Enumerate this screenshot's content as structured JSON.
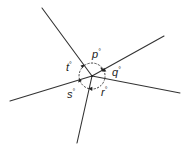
{
  "diagram": {
    "rays": [
      {
        "name": "upper-left"
      },
      {
        "name": "upper-right"
      },
      {
        "name": "right"
      },
      {
        "name": "lower"
      },
      {
        "name": "left"
      }
    ],
    "angles": [
      {
        "id": "p",
        "letter": "p",
        "unit": "°",
        "between": [
          "upper-left",
          "upper-right"
        ]
      },
      {
        "id": "q",
        "letter": "q",
        "unit": "°",
        "between": [
          "upper-right",
          "right"
        ]
      },
      {
        "id": "r",
        "letter": "r",
        "unit": "°",
        "between": [
          "right",
          "lower"
        ]
      },
      {
        "id": "s",
        "letter": "s",
        "unit": "°",
        "between": [
          "lower",
          "left"
        ]
      },
      {
        "id": "t",
        "letter": "t",
        "unit": "°",
        "between": [
          "left",
          "upper-left"
        ]
      }
    ],
    "colors": {
      "line": "#333333",
      "text": "#222222",
      "background": "#ffffff"
    }
  }
}
